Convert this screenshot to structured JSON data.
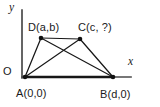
{
  "figure": {
    "background_color": "#ffffff",
    "ink_color": "#171717",
    "axis_color": "#4a4a4a"
  },
  "axes": {
    "y_label": "y",
    "x_label": "x",
    "origin_label": "O"
  },
  "points": {
    "a": {
      "name": "A",
      "coords": "(0,0)",
      "full": "A(0,0)"
    },
    "b": {
      "name": "B",
      "coords": "(d,0)",
      "full": "B(d,0)"
    },
    "c": {
      "name": "C",
      "coords": "(c, ?)",
      "full": "C(c, ?)"
    },
    "d": {
      "name": "D",
      "coords": "(a,b)",
      "full": "D(a,b)"
    }
  },
  "chart_data": {
    "type": "scatter",
    "xlabel": "x",
    "ylabel": "y",
    "grid": false,
    "legend": null,
    "annotations": [
      "O",
      "A(0,0)",
      "B(d,0)",
      "C(c, ?)",
      "D(a,b)"
    ],
    "vertices": [
      {
        "label": "A",
        "text": "A(0,0)",
        "px": 25,
        "py": 77
      },
      {
        "label": "B",
        "text": "B(d,0)",
        "px": 113,
        "py": 77
      },
      {
        "label": "C",
        "text": "C(c, ?)",
        "px": 80,
        "py": 39
      },
      {
        "label": "D",
        "text": "D(a,b)",
        "px": 41,
        "py": 38
      }
    ],
    "edges": [
      {
        "from": "A",
        "to": "B",
        "kind": "base"
      },
      {
        "from": "B",
        "to": "C",
        "kind": "side"
      },
      {
        "from": "C",
        "to": "D",
        "kind": "top"
      },
      {
        "from": "D",
        "to": "A",
        "kind": "side"
      },
      {
        "from": "A",
        "to": "C",
        "kind": "diagonal"
      },
      {
        "from": "B",
        "to": "D",
        "kind": "diagonal"
      }
    ],
    "axis_segments": [
      {
        "name": "y-axis",
        "x1": 22,
        "y1": 10,
        "x2": 22,
        "y2": 78
      },
      {
        "name": "x-axis",
        "x1": 22,
        "y1": 77,
        "x2": 131,
        "y2": 77
      }
    ]
  }
}
